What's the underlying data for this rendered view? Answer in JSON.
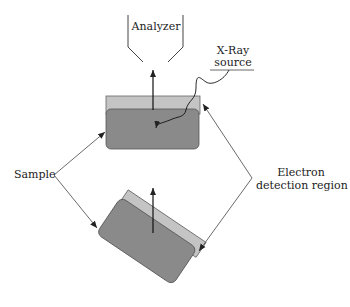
{
  "labels": {
    "analyzer": "Analyzer",
    "xray_line1": "X-Ray",
    "xray_line2": "source",
    "sample": "Sample",
    "electron_line1": "Electron",
    "electron_line2": "detection region"
  },
  "colors": {
    "surface_layer": "#c4c4c4",
    "sample_body": "#8a8a8a",
    "outline": "#555555",
    "line": "#333333"
  }
}
